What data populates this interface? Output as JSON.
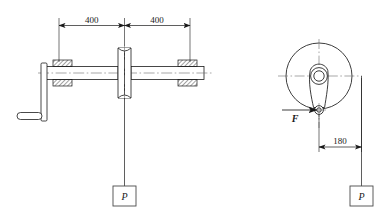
{
  "drawing": {
    "title": "Winch shaft loading diagram",
    "stroke_color": "#1a1a1a",
    "background_color": "#ffffff",
    "hatch_color": "#555555"
  },
  "left_view": {
    "name": "shaft-elevation-view",
    "dimensions": [
      {
        "id": "dim-left-400",
        "value": "400"
      },
      {
        "id": "dim-right-400",
        "value": "400"
      }
    ],
    "load_label": "P"
  },
  "right_view": {
    "name": "crank-disc-end-view",
    "force_label": "F",
    "dimension": "180",
    "load_label": "P"
  },
  "icons": {
    "arrow": "arrow-icon",
    "hatch": "section-hatch-icon",
    "centerline": "centerline-icon"
  }
}
